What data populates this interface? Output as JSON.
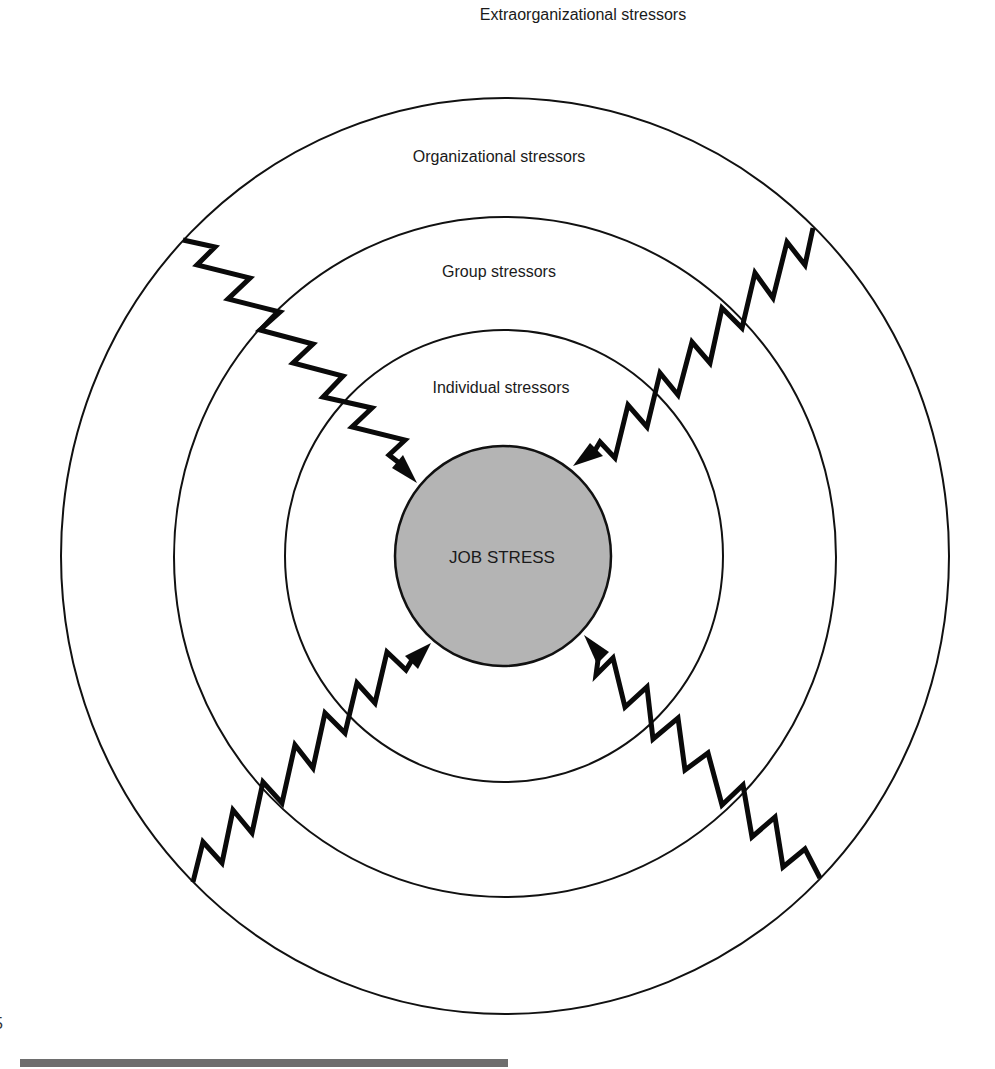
{
  "diagram": {
    "top_label": "Extraorganizational stressors",
    "rings": [
      {
        "name": "organizational",
        "label": "Organizational stressors"
      },
      {
        "name": "group",
        "label": "Group stressors"
      },
      {
        "name": "individual",
        "label": "Individual stressors"
      }
    ],
    "center": {
      "label": "JOB STRESS",
      "fill_color": "#b4b4b4"
    },
    "arrows": [
      {
        "direction": "upper-left to center"
      },
      {
        "direction": "upper-right to center"
      },
      {
        "direction": "lower-left to center"
      },
      {
        "direction": "lower-right to center"
      }
    ],
    "colors": {
      "line": "#111111",
      "center_fill": "#b4b4b4",
      "bottom_rule": "#6e6e6e",
      "background": "#ffffff"
    },
    "page_fragment": "5"
  }
}
